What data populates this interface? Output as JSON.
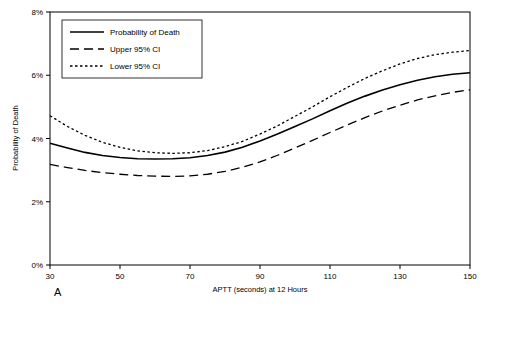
{
  "panel": {
    "letter": "A"
  },
  "legend": {
    "entries": [
      {
        "label": "Probability of Death",
        "style": "solid"
      },
      {
        "label": "Upper 95% CI",
        "style": "dashed"
      },
      {
        "label": "Lower 95% CI",
        "style": "dotted"
      }
    ]
  },
  "chart_data": {
    "type": "line",
    "title": "",
    "xlabel": "APTT (seconds) at 12 Hours",
    "ylabel": "Probability of Death",
    "xlim": [
      30,
      150
    ],
    "ylim": [
      0,
      8
    ],
    "xticks": [
      30,
      50,
      70,
      90,
      110,
      130,
      150
    ],
    "xticklabels": [
      "30",
      "50",
      "70",
      "90",
      "110",
      "130",
      "150"
    ],
    "yticks": [
      0,
      2,
      4,
      6,
      8
    ],
    "yticklabels": [
      "0%",
      "2%",
      "4%",
      "6%",
      "8%"
    ],
    "grid": false,
    "legend_position": "top-left",
    "x": [
      30,
      35,
      40,
      45,
      50,
      55,
      60,
      65,
      70,
      75,
      80,
      85,
      90,
      95,
      100,
      105,
      110,
      115,
      120,
      125,
      130,
      135,
      140,
      145,
      150
    ],
    "series": [
      {
        "name": "Probability of Death",
        "style": "solid",
        "values": [
          3.85,
          3.7,
          3.56,
          3.46,
          3.4,
          3.36,
          3.35,
          3.36,
          3.39,
          3.46,
          3.57,
          3.72,
          3.92,
          4.14,
          4.38,
          4.62,
          4.88,
          5.12,
          5.34,
          5.53,
          5.7,
          5.84,
          5.95,
          6.03,
          6.08
        ]
      },
      {
        "name": "Upper 95% CI",
        "style": "dotted",
        "values": [
          4.72,
          4.38,
          4.1,
          3.88,
          3.72,
          3.61,
          3.55,
          3.53,
          3.55,
          3.62,
          3.74,
          3.91,
          4.14,
          4.4,
          4.7,
          5.0,
          5.32,
          5.62,
          5.9,
          6.14,
          6.36,
          6.53,
          6.65,
          6.73,
          6.78
        ]
      },
      {
        "name": "Lower 95% CI",
        "style": "dashed",
        "values": [
          3.18,
          3.08,
          2.99,
          2.92,
          2.87,
          2.83,
          2.81,
          2.8,
          2.82,
          2.87,
          2.96,
          3.09,
          3.26,
          3.47,
          3.7,
          3.94,
          4.19,
          4.43,
          4.66,
          4.87,
          5.05,
          5.22,
          5.35,
          5.46,
          5.54
        ]
      }
    ]
  }
}
